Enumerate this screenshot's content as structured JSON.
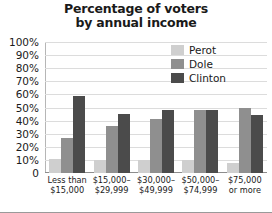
{
  "chart_data": {
    "type": "bar",
    "title": "Percentage of voters by annual income",
    "title_line1": "Percentage of voters",
    "title_line2": "by annual income",
    "xlabel": "",
    "ylabel": "",
    "ylim": [
      0,
      100
    ],
    "yticks": [
      "100%",
      "90%",
      "80%",
      "70%",
      "60%",
      "50%",
      "40%",
      "30%",
      "20%",
      "10%",
      "0"
    ],
    "ytick_values": [
      100,
      90,
      80,
      70,
      60,
      50,
      40,
      30,
      20,
      10,
      0
    ],
    "grid": true,
    "legend_position": "upper right",
    "categories": [
      "Less than\n$15,000",
      "$15,000–\n$29,999",
      "$30,000–\n$49,999",
      "$50,000–\n$74,999",
      "$75,000\nor more"
    ],
    "series": [
      {
        "name": "Perot",
        "color": "#cfcfcf",
        "values": [
          11,
          10,
          10,
          10,
          8
        ]
      },
      {
        "name": "Dole",
        "color": "#8f8f8f",
        "values": [
          27,
          36,
          41,
          48,
          50
        ]
      },
      {
        "name": "Clinton",
        "color": "#4b4b4b",
        "values": [
          59,
          45,
          48,
          48,
          44
        ]
      }
    ]
  },
  "legend": {
    "items": [
      {
        "label": "Perot"
      },
      {
        "label": "Dole"
      },
      {
        "label": "Clinton"
      }
    ]
  }
}
